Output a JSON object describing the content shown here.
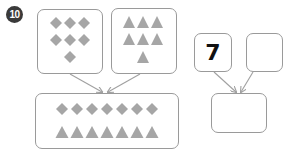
{
  "problem_number": "10",
  "colors": {
    "shape": "#a6a6a6",
    "border": "#9a9a9a",
    "arrow": "#a0a0a0",
    "badge": "#3a3a3a"
  },
  "left_diagram": {
    "box_a": {
      "shape": "diamond",
      "count": 7,
      "rows": [
        3,
        3,
        1
      ]
    },
    "box_b": {
      "shape": "triangle",
      "count": 7,
      "rows": [
        3,
        3,
        1
      ]
    },
    "combined": {
      "diamonds": 7,
      "triangles": 7
    }
  },
  "right_diagram": {
    "input_a": "7",
    "input_b": "",
    "result": ""
  }
}
